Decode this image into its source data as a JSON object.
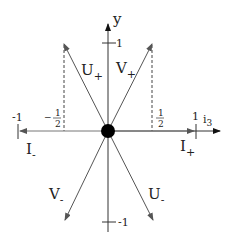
{
  "diagram": {
    "axes": {
      "x_label": "i",
      "x_label_subscript": "3",
      "y_label": "y",
      "tick_x_neg1": "-1",
      "tick_x_pos1": "1",
      "tick_y_pos1": "1",
      "tick_y_neg1": "-1",
      "half_neg_sign": "−",
      "half_num": "1",
      "half_den": "2"
    },
    "vectors": [
      {
        "name": "U",
        "sign": "+"
      },
      {
        "name": "V",
        "sign": "+"
      },
      {
        "name": "V",
        "sign": "-"
      },
      {
        "name": "U",
        "sign": "-"
      },
      {
        "name": "I",
        "sign": "-"
      },
      {
        "name": "I",
        "sign": "+"
      }
    ],
    "colors": {
      "axis": "#111111",
      "vector": "#666666",
      "origin_dot": "#000000",
      "dashed": "#444444"
    }
  }
}
